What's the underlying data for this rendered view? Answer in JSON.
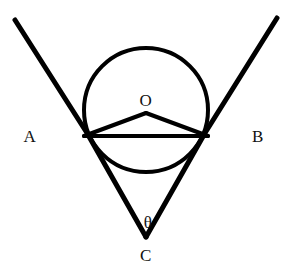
{
  "figure": {
    "type": "geometry-diagram",
    "width": 295,
    "height": 278,
    "background_color": "#ffffff",
    "stroke_color": "#000000",
    "label_color": "#111111"
  },
  "labels": {
    "ray_left": "A",
    "ray_right": "B",
    "circle_center": "O",
    "apex": "C",
    "angle": "θ"
  },
  "geometry": {
    "circle": {
      "center_x": 146,
      "center_y": 110,
      "radius": 62,
      "stroke_width": 4
    },
    "apex": {
      "x": 146,
      "y": 237
    },
    "tangent_point_left": {
      "x": 87,
      "y": 133
    },
    "tangent_point_right": {
      "x": 205,
      "y": 133
    },
    "ray_left_start": {
      "x": 15,
      "y": 20
    },
    "ray_right_start": {
      "x": 277,
      "y": 18
    },
    "triangle_apex": {
      "x": 146,
      "y": 113
    },
    "chord_left": {
      "x": 84,
      "y": 136
    },
    "chord_right": {
      "x": 208,
      "y": 136
    },
    "line_stroke_width": 5,
    "chord_stroke_width": 4
  },
  "label_positions": {
    "ray_left": {
      "x": 30,
      "y": 136
    },
    "ray_right": {
      "x": 258,
      "y": 136
    },
    "circle_center": {
      "x": 146,
      "y": 100
    },
    "apex": {
      "x": 146,
      "y": 255
    },
    "angle": {
      "x": 148,
      "y": 222
    }
  }
}
